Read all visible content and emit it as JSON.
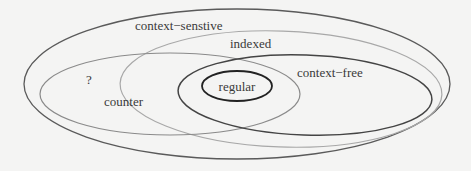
{
  "diagram": {
    "background": "#f4f4f3",
    "sets": [
      {
        "id": "context-sensitive",
        "label": "context−senstive",
        "shape": {
          "cx": 237,
          "cy": 84,
          "rx": 213,
          "ry": 75,
          "rotate": 0
        },
        "stroke": "#5a5a5a",
        "stroke_width": 1.3,
        "label_pos": {
          "x": 135,
          "y": 30
        }
      },
      {
        "id": "indexed",
        "label": "indexed",
        "shape": {
          "cx": 281,
          "cy": 89,
          "rx": 161,
          "ry": 58,
          "rotate": 2
        },
        "stroke": "#a8a8a8",
        "stroke_width": 1.2,
        "label_pos": {
          "x": 230,
          "y": 48
        }
      },
      {
        "id": "counter",
        "label": "counter",
        "shape": {
          "cx": 170,
          "cy": 94,
          "rx": 130,
          "ry": 41,
          "rotate": 0
        },
        "stroke": "#8a8a8a",
        "stroke_width": 1.2,
        "label_pos": {
          "x": 104,
          "y": 106
        }
      },
      {
        "id": "unknown",
        "label": "?",
        "label_pos": {
          "x": 86,
          "y": 84
        }
      },
      {
        "id": "context-free",
        "label": "context−free",
        "shape": {
          "cx": 305,
          "cy": 95,
          "rx": 127,
          "ry": 40,
          "rotate": 2
        },
        "stroke": "#444444",
        "stroke_width": 1.5,
        "label_pos": {
          "x": 297,
          "y": 77
        }
      },
      {
        "id": "regular",
        "label": "regular",
        "shape": {
          "cx": 237,
          "cy": 86,
          "rx": 35,
          "ry": 15,
          "rotate": 0
        },
        "stroke": "#222222",
        "stroke_width": 1.8,
        "label_pos": {
          "x": 237,
          "y": 91
        }
      }
    ]
  }
}
